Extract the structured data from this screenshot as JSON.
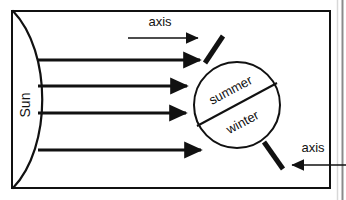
{
  "figure": {
    "title_none": "",
    "background_color": "#ffffff",
    "ink_color": "#111111",
    "frame": {
      "name": "diagram-frame",
      "x": 11,
      "y": 10,
      "width": 319,
      "height": 179,
      "stroke_width": 2
    },
    "outer_edge": {
      "name": "page-edge",
      "x": 342,
      "stroke_width": 2
    }
  },
  "sun": {
    "label": "Sun",
    "rotation_deg": -90,
    "arc": {
      "name": "sun-arc",
      "start_x": 13,
      "start_y": 11,
      "end_x": 13,
      "end_y": 188,
      "bulge_x": 46
    }
  },
  "rays": {
    "label": "sunlight-rays",
    "count": 4,
    "stroke_width": 3,
    "items": [
      {
        "id": "ray-1",
        "x1": 37,
        "y1": 60,
        "x2": 206,
        "y2": 60
      },
      {
        "id": "ray-2",
        "x1": 38,
        "y1": 86,
        "x2": 193,
        "y2": 86
      },
      {
        "id": "ray-3",
        "x1": 38,
        "y1": 113,
        "x2": 192,
        "y2": 113
      },
      {
        "id": "ray-4",
        "x1": 38,
        "y1": 150,
        "x2": 207,
        "y2": 150
      }
    ]
  },
  "planet": {
    "name": "planet-circle",
    "cx": 237,
    "cy": 105,
    "r": 43,
    "stroke_width": 2,
    "divider": {
      "name": "equator-line",
      "x1": 199,
      "y1": 126,
      "x2": 276,
      "y2": 84,
      "stroke_width": 2
    },
    "hemispheres": [
      {
        "id": "summer-label",
        "label": "summer",
        "x": 231,
        "y": 90,
        "rotation_deg": -28
      },
      {
        "id": "winter-label",
        "label": "winter",
        "x": 242,
        "y": 122,
        "rotation_deg": -28
      }
    ]
  },
  "axis_top": {
    "label": "axis",
    "label_x": 160,
    "label_y": 26,
    "stub": {
      "name": "axis-stub-top",
      "x1": 205,
      "y1": 62,
      "x2": 223,
      "y2": 36,
      "stroke_width": 5
    },
    "pointer": {
      "name": "axis-pointer-top",
      "x1": 128,
      "y1": 38,
      "x2": 205,
      "y2": 38,
      "direction": "right",
      "stroke_width": 1.6
    }
  },
  "axis_bottom": {
    "label": "axis",
    "label_x": 313,
    "label_y": 152,
    "stub": {
      "name": "axis-stub-bottom",
      "x1": 264,
      "y1": 142,
      "x2": 283,
      "y2": 168,
      "stroke_width": 5
    },
    "pointer": {
      "name": "axis-pointer-bottom",
      "x1": 345,
      "y1": 165,
      "x2": 286,
      "y2": 165,
      "direction": "left",
      "stroke_width": 1.6
    }
  }
}
